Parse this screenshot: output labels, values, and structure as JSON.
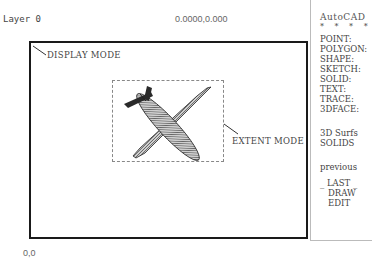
{
  "status_bar": {
    "layer": "Layer 0",
    "coordinates": "0.0000,0.000"
  },
  "drawing": {
    "display_mode_label": "DISPLAY MODE",
    "extent_mode_label": "EXTENT MODE",
    "object": "airplane-3d-mesh"
  },
  "origin_label": "0,0",
  "screen_menu": {
    "title": "AutoCAD",
    "stars": "* * * *",
    "items": [
      "POINT:",
      "POLYGON:",
      "SHAPE:",
      "SKETCH:",
      "SOLID:",
      "TEXT:",
      "TRACE:",
      "3DFACE:"
    ],
    "group2": [
      "3D Surfs",
      "SOLIDS"
    ],
    "previous": "previous",
    "last": "_ LAST _",
    "draw": "DRAW",
    "edit": "EDIT"
  }
}
